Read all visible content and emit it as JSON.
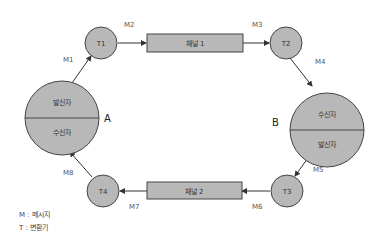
{
  "colors": {
    "fill": "#b8b8b8",
    "stroke": "#444444",
    "text": "#333333"
  },
  "parties": {
    "a": {
      "label": "A",
      "top": "발신자",
      "bottom": "수신자"
    },
    "b": {
      "label": "B",
      "top": "수신자",
      "bottom": "발신자"
    }
  },
  "transformers": {
    "t1": "T1",
    "t2": "T2",
    "t3": "T3",
    "t4": "T4"
  },
  "channels": {
    "c1": "채널 1",
    "c2": "채널 2"
  },
  "messages": {
    "m1": "M1",
    "m2": "M2",
    "m3": "M3",
    "m4": "M4",
    "m5": "M5",
    "m6": "M6",
    "m7": "M7",
    "m8": "M8"
  },
  "legend": {
    "m": "M : 메시지",
    "t": "T : 변환기"
  }
}
